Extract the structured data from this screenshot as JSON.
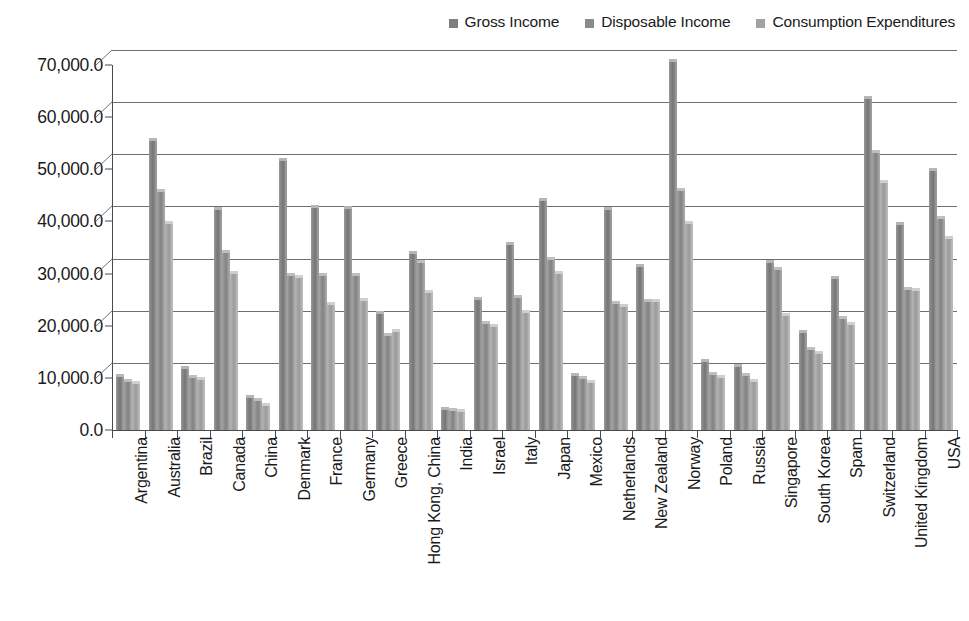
{
  "chart_data": {
    "type": "bar",
    "title": "",
    "subtitle": "",
    "xlabel": "",
    "ylabel": "",
    "ylim": [
      0,
      70000
    ],
    "ytick_labels": [
      "0.0",
      "10,000.0",
      "20,000.0",
      "30,000.0",
      "40,000.0",
      "50,000.0",
      "60,000.0",
      "70,000.0"
    ],
    "ytick_values": [
      0,
      10000,
      20000,
      30000,
      40000,
      50000,
      60000,
      70000
    ],
    "grid": true,
    "legend_position": "top-right",
    "categories": [
      "Argentina",
      "Australia",
      "Brazil",
      "Canada",
      "China",
      "Denmark",
      "France",
      "Germany",
      "Greece",
      "Hong Kong, China",
      "India",
      "Israel",
      "Italy",
      "Japan",
      "Mexico",
      "Netherlands",
      "New Zealand",
      "Norway",
      "Poland",
      "Russia",
      "Singapore",
      "South Korea",
      "Spam",
      "Switzerland",
      "United Kingdom",
      "USA"
    ],
    "series": [
      {
        "name": "Gross Income",
        "color": "#7e7e7e",
        "values": [
          10100,
          55400,
          11700,
          42200,
          6100,
          51500,
          42500,
          42300,
          22200,
          33800,
          3900,
          25000,
          35500,
          44000,
          10400,
          42200,
          31200,
          70500,
          13100,
          12100,
          32000,
          18700,
          29000,
          63500,
          39300,
          49600
        ]
      },
      {
        "name": "Disposable Income",
        "color": "#8b8b8b",
        "values": [
          9300,
          45700,
          10000,
          34000,
          5600,
          29600,
          29500,
          29500,
          18000,
          32000,
          3600,
          20300,
          25400,
          32600,
          9700,
          24200,
          24600,
          45800,
          10600,
          10400,
          30700,
          15300,
          21200,
          53200,
          26900,
          40400
        ]
      },
      {
        "name": "Consumption Expenditures",
        "color": "#a2a2a2",
        "values": [
          8800,
          39500,
          9500,
          30000,
          4700,
          29200,
          24000,
          24800,
          18800,
          26200,
          3400,
          19800,
          22400,
          30000,
          9000,
          23500,
          24500,
          39500,
          10000,
          9300,
          21800,
          14500,
          20100,
          47300,
          26700,
          36700
        ]
      }
    ]
  },
  "legend": {
    "entries": [
      {
        "label": "Gross Income",
        "color": "#7e7e7e"
      },
      {
        "label": "Disposable Income",
        "color": "#8b8b8b"
      },
      {
        "label": "Consumption Expenditures",
        "color": "#a2a2a2"
      }
    ]
  },
  "axes": {
    "y_max": 70000,
    "y_min": 0,
    "y_step": 10000
  }
}
